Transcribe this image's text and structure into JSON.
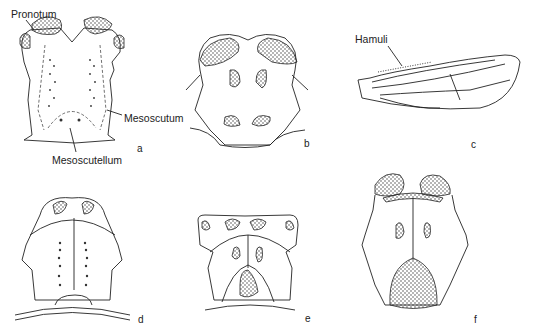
{
  "figure": {
    "panels": [
      {
        "id": "a",
        "label": "a",
        "annotations": [
          "Pronotum",
          "Mesoscutum",
          "Mesoscutellum"
        ]
      },
      {
        "id": "b",
        "label": "b"
      },
      {
        "id": "c",
        "label": "c",
        "annotations": [
          "Hamuli"
        ]
      },
      {
        "id": "d",
        "label": "d"
      },
      {
        "id": "e",
        "label": "e"
      },
      {
        "id": "f",
        "label": "f"
      }
    ],
    "labels": {
      "pronotum": "Pronotum",
      "mesoscutum": "Mesoscutum",
      "mesoscutellum": "Mesoscutellum",
      "hamuli": "Hamuli"
    }
  }
}
